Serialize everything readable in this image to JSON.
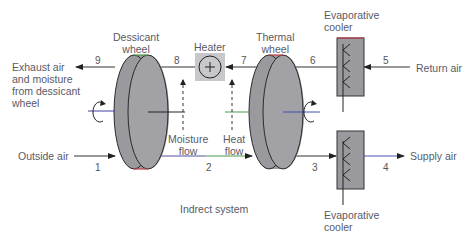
{
  "title": "Indrect system",
  "components": {
    "dessicant_wheel": "Dessicant\nwheel",
    "heater": "Heater",
    "thermal_wheel": "Thermal\nwheel",
    "evap_cooler_top": "Evaporative\ncooler",
    "evap_cooler_bottom": "Evaporative\ncooler"
  },
  "streams": {
    "exhaust": "Exhaust air\nand moisture\nfrom dessicant\nwheel",
    "return_air": "Return air",
    "outside_air": "Outside air",
    "supply_air": "Supply air",
    "moisture_flow": "Moisture\nflow",
    "heat_flow": "Heat\nflow"
  },
  "points": [
    "1",
    "2",
    "3",
    "4",
    "5",
    "6",
    "7",
    "8",
    "9"
  ],
  "heater_symbol": "+",
  "colors": {
    "wheel_fill": "#9a9a9e",
    "wheel_stroke": "#2a2a2a",
    "line": "#333333",
    "heater_bg": "#c8c8cc",
    "accent_green": "#4a9a4a",
    "accent_red": "#c0404a",
    "accent_blue": "#5050c0",
    "text": "#5a5a66"
  }
}
